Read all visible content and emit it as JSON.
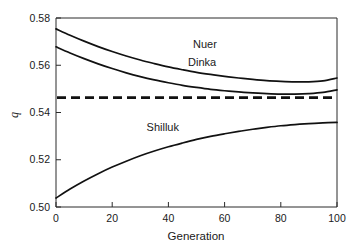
{
  "chart_data": {
    "type": "line",
    "title": "",
    "xlabel": "Generation",
    "ylabel": "q",
    "xlim": [
      0,
      100
    ],
    "ylim": [
      0.5,
      0.58
    ],
    "grid": false,
    "legend_position": "inline-labels",
    "xticks": [
      0,
      20,
      40,
      60,
      80,
      100
    ],
    "xticklabels": [
      "0",
      "20",
      "40",
      "60",
      "80",
      "100"
    ],
    "yticks": [
      0.5,
      0.52,
      0.54,
      0.56,
      0.58
    ],
    "yticklabels": [
      "0.50",
      "0.52",
      "0.54",
      "0.56",
      "0.58"
    ],
    "x": [
      0,
      5,
      10,
      15,
      20,
      25,
      30,
      35,
      40,
      45,
      50,
      55,
      60,
      65,
      70,
      75,
      80,
      85,
      90,
      95,
      100
    ],
    "series": [
      {
        "name": "Nuer",
        "label": "Nuer",
        "style": "solid",
        "values": [
          0.5754,
          0.5727,
          0.5702,
          0.5679,
          0.5658,
          0.5639,
          0.5622,
          0.5607,
          0.5593,
          0.5581,
          0.557,
          0.5561,
          0.5553,
          0.5546,
          0.554,
          0.5535,
          0.5532,
          0.553,
          0.553,
          0.5534,
          0.5546
        ]
      },
      {
        "name": "Dinka",
        "label": "Dinka",
        "style": "solid",
        "values": [
          0.5678,
          0.5652,
          0.5628,
          0.5606,
          0.5586,
          0.5568,
          0.5552,
          0.5538,
          0.5526,
          0.5515,
          0.5506,
          0.5498,
          0.5492,
          0.5487,
          0.5483,
          0.548,
          0.5478,
          0.5478,
          0.548,
          0.5485,
          0.5496
        ]
      },
      {
        "name": "Shilluk",
        "label": "Shilluk",
        "style": "solid",
        "values": [
          0.5038,
          0.5076,
          0.511,
          0.5141,
          0.5169,
          0.5194,
          0.5217,
          0.5237,
          0.5255,
          0.5271,
          0.5286,
          0.5299,
          0.531,
          0.532,
          0.5329,
          0.5337,
          0.5344,
          0.5349,
          0.5353,
          0.5356,
          0.5358
        ]
      }
    ],
    "annotations": [
      {
        "name": "equilibrium-line",
        "type": "hline",
        "value": 0.5463,
        "style": "dashed"
      }
    ],
    "series_label_positions": [
      {
        "name": "Nuer",
        "x": 53,
        "y": 0.5672
      },
      {
        "name": "Dinka",
        "x": 52,
        "y": 0.5596
      },
      {
        "name": "Shilluk",
        "x": 38,
        "y": 0.5322
      }
    ]
  }
}
